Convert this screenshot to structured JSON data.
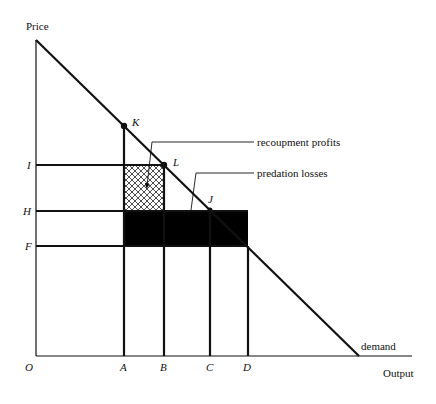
{
  "diagram": {
    "axes": {
      "y_label": "Price",
      "x_label": "Output",
      "origin_label": "O"
    },
    "price_levels": [
      {
        "label": "I",
        "y": 165
      },
      {
        "label": "H",
        "y": 211
      },
      {
        "label": "F",
        "y": 246
      }
    ],
    "output_levels": [
      {
        "label": "A",
        "x": 124
      },
      {
        "label": "B",
        "x": 164
      },
      {
        "label": "C",
        "x": 210
      },
      {
        "label": "D",
        "x": 248
      }
    ],
    "points": [
      {
        "label": "K",
        "x": 124,
        "y": 126
      },
      {
        "label": "L",
        "x": 164,
        "y": 165
      },
      {
        "label": "J",
        "x": 210,
        "y": 210
      }
    ],
    "curve_label": "demand",
    "annotations": {
      "recoupment": "recoupment profits",
      "predation": "predation losses"
    },
    "colors": {
      "ink": "#111111",
      "background": "#ffffff"
    }
  }
}
